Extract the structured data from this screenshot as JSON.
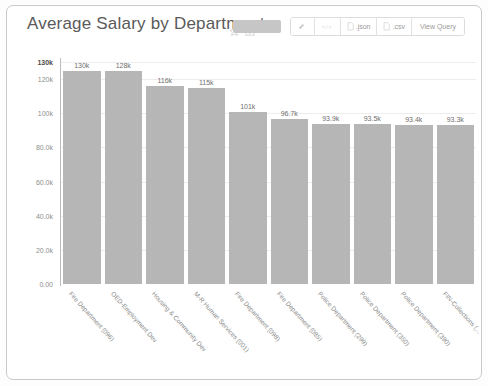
{
  "header": {
    "title": "Average Salary by Department",
    "icons": [
      {
        "name": "star-icon"
      },
      {
        "name": "edit-icon"
      }
    ],
    "pill_label": "",
    "buttons": [
      {
        "name": "pen-icon",
        "label": "",
        "icon": "pen"
      },
      {
        "name": "embed-icon",
        "label": "",
        "icon": "embed"
      },
      {
        "name": "download-json",
        "label": ".json",
        "icon": "file"
      },
      {
        "name": "download-csv",
        "label": ".csv",
        "icon": "file"
      },
      {
        "name": "view-query",
        "label": "View Query",
        "icon": "none"
      }
    ]
  },
  "chart_data": {
    "type": "bar",
    "title": "Average Salary by Department",
    "xlabel": "",
    "ylabel": "",
    "ylim": [
      0,
      130000
    ],
    "grid": true,
    "legend": "none",
    "orientation": "vertical",
    "bar_color": "#b6b6b6",
    "categories": [
      "Fire Department (096)",
      "OED-Employment Dev",
      "Housing & Community Dev",
      "M-R Human Services (001)",
      "Fire Department (098)",
      "Fire Department (085)",
      "Police Department (299)",
      "Police Department (350)",
      "Police Department (390)",
      "FIN-Collections (..."
    ],
    "values": [
      130000,
      128000,
      116000,
      115000,
      101000,
      96700,
      93900,
      93500,
      93400,
      93300
    ],
    "value_labels": [
      "130k",
      "128k",
      "116k",
      "115k",
      "101k",
      "96.7k",
      "93.9k",
      "93.5k",
      "93.4k",
      "93.3k"
    ],
    "ytick_values": [
      0,
      20000,
      40000,
      60000,
      80000,
      100000,
      120000,
      130000
    ],
    "ytick_labels": [
      "0.00",
      "20.0k",
      "40.0k",
      "60.0k",
      "80.0k",
      "100k",
      "120k",
      "130k"
    ]
  }
}
